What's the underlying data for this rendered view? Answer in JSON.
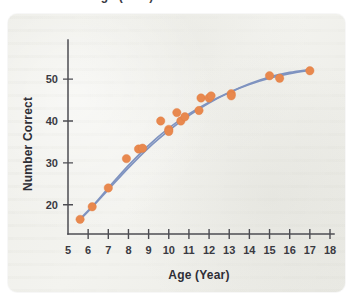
{
  "figure": {
    "top_cropped_caption": "Age (Year)",
    "background_color": "#f2f2ee",
    "page_color": "#ffffff"
  },
  "chart_data": {
    "type": "scatter",
    "title": "",
    "xlabel": "Age (Year)",
    "ylabel": "Number Correct",
    "xlim": [
      5,
      18
    ],
    "ylim": [
      13,
      56
    ],
    "xticks": [
      5,
      6,
      7,
      8,
      9,
      10,
      11,
      12,
      13,
      14,
      15,
      16,
      17,
      18
    ],
    "yticks": [
      20,
      30,
      40,
      50
    ],
    "xtick_labels": [
      "5",
      "6",
      "7",
      "8",
      "9",
      "10",
      "11",
      "12",
      "13",
      "14",
      "15",
      "16",
      "17",
      "18"
    ],
    "ytick_labels": [
      "20",
      "30",
      "40",
      "50"
    ],
    "grid": false,
    "legend": null,
    "point_color": "#e8884e",
    "curve_color": "#7f93c0",
    "series": [
      {
        "name": "Observed scores",
        "type": "scatter",
        "points": [
          {
            "x": 5.6,
            "y": 16.5
          },
          {
            "x": 6.2,
            "y": 19.5
          },
          {
            "x": 7.0,
            "y": 24.0
          },
          {
            "x": 7.9,
            "y": 31.0
          },
          {
            "x": 8.5,
            "y": 33.3
          },
          {
            "x": 8.7,
            "y": 33.5
          },
          {
            "x": 9.6,
            "y": 40.0
          },
          {
            "x": 10.0,
            "y": 38.0
          },
          {
            "x": 10.0,
            "y": 37.5
          },
          {
            "x": 10.4,
            "y": 42.0
          },
          {
            "x": 10.6,
            "y": 40.0
          },
          {
            "x": 10.8,
            "y": 41.0
          },
          {
            "x": 11.5,
            "y": 42.5
          },
          {
            "x": 11.6,
            "y": 45.5
          },
          {
            "x": 12.0,
            "y": 45.5
          },
          {
            "x": 12.1,
            "y": 46.0
          },
          {
            "x": 13.1,
            "y": 46.5
          },
          {
            "x": 13.1,
            "y": 46.0
          },
          {
            "x": 15.0,
            "y": 50.8
          },
          {
            "x": 15.5,
            "y": 50.2
          },
          {
            "x": 17.0,
            "y": 52.0
          }
        ]
      },
      {
        "name": "Fitted curve A",
        "type": "line",
        "points": [
          {
            "x": 5.6,
            "y": 16.6
          },
          {
            "x": 6.2,
            "y": 19.6
          },
          {
            "x": 7.0,
            "y": 24.0
          },
          {
            "x": 8.0,
            "y": 29.4
          },
          {
            "x": 9.0,
            "y": 34.2
          },
          {
            "x": 10.0,
            "y": 38.3
          },
          {
            "x": 11.0,
            "y": 41.7
          },
          {
            "x": 12.0,
            "y": 44.5
          },
          {
            "x": 13.0,
            "y": 46.8
          },
          {
            "x": 14.0,
            "y": 48.7
          },
          {
            "x": 15.0,
            "y": 50.2
          },
          {
            "x": 16.0,
            "y": 51.3
          },
          {
            "x": 17.0,
            "y": 52.1
          }
        ]
      },
      {
        "name": "Fitted curve B",
        "type": "line",
        "points": [
          {
            "x": 5.6,
            "y": 16.4
          },
          {
            "x": 6.2,
            "y": 19.4
          },
          {
            "x": 7.0,
            "y": 23.6
          },
          {
            "x": 8.0,
            "y": 28.8
          },
          {
            "x": 9.0,
            "y": 33.6
          },
          {
            "x": 10.0,
            "y": 37.7
          },
          {
            "x": 11.0,
            "y": 41.3
          },
          {
            "x": 12.0,
            "y": 44.3
          },
          {
            "x": 13.0,
            "y": 46.8
          },
          {
            "x": 14.0,
            "y": 48.9
          },
          {
            "x": 15.0,
            "y": 50.5
          },
          {
            "x": 16.0,
            "y": 51.6
          },
          {
            "x": 17.0,
            "y": 52.3
          }
        ]
      }
    ]
  }
}
